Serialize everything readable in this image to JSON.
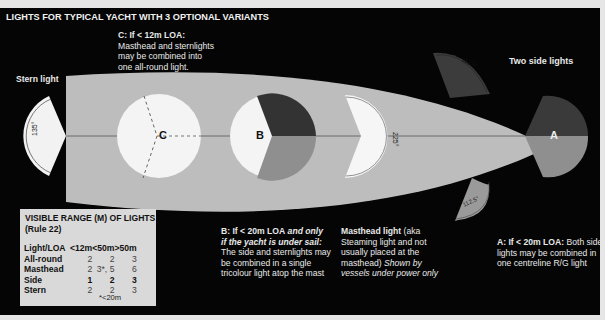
{
  "title": "LIGHTS FOR TYPICAL YACHT WITH 3 OPTIONAL VARIANTS",
  "labels": {
    "stern_light": "Stern light",
    "two_side_lights": "Two side lights",
    "marker_c": "C",
    "marker_b": "B",
    "marker_a": "A",
    "angle_stern": "135°",
    "angle_masthead": "225°",
    "angle_side_top": "112.5°",
    "angle_side_bottom": "112.5°"
  },
  "notes": {
    "c": {
      "heading": "C: If < 12m LOA:",
      "lines": [
        "Masthead and sternlights",
        "may be combined into",
        "one all-round light."
      ]
    },
    "b": {
      "heading": "B: If < 20m LOA",
      "heading_italic": " and only",
      "line2_italic": "if the yacht is under sail:",
      "lines": [
        "The side and sternlights may",
        "be combined in a single",
        "tricolour light atop the mast"
      ]
    },
    "masthead": {
      "heading": "Masthead light",
      "heading_tail": "  (aka",
      "lines": [
        "Steaming light and not",
        "usually placed at the",
        "masthead)"
      ],
      "italic_a": " Shown by",
      "italic_b": "vessels under power only"
    },
    "a": {
      "heading": "A: If < 20m LOA:",
      "heading_tail": " Both side",
      "lines": [
        "lights may be combined in",
        "one centreline R/G light"
      ]
    }
  },
  "range_table": {
    "heading_line1": "VISIBLE RANGE (M) OF LIGHTS",
    "heading_line2": "(Rule 22)",
    "columns": [
      "Light/LOA",
      "<12m",
      "<50m",
      ">50m"
    ],
    "rows": [
      {
        "label": "All-round",
        "values": [
          "2",
          "2",
          "3"
        ],
        "bold": false
      },
      {
        "label": "Masthead",
        "values": [
          "2",
          "3*, 5",
          "6"
        ],
        "bold": false
      },
      {
        "label": "Side",
        "values": [
          "1",
          "2",
          "3"
        ],
        "bold": true
      },
      {
        "label": "Stern",
        "values": [
          "2",
          "2",
          "3"
        ],
        "bold": false
      }
    ],
    "footnote": "*<20m"
  },
  "colors": {
    "background": "#050505",
    "hull": "#bdbdbd",
    "light_white": "#f4f4f4",
    "port_sector": "#3a3a3a",
    "starboard_sector": "#8f8f8f",
    "table_bg": "#d9d9d9"
  }
}
